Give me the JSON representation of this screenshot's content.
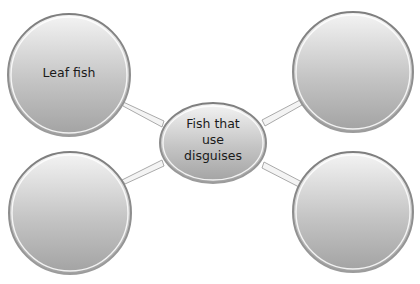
{
  "diagram": {
    "type": "bubble-map",
    "center": {
      "label_lines": [
        "Fish that",
        "use",
        "disguises"
      ],
      "shape": "ellipse",
      "cx": 213,
      "cy": 143,
      "rx": 53,
      "ry": 40
    },
    "branches": [
      {
        "position": "top-left",
        "label": "Leaf fish",
        "cx": 69,
        "cy": 75,
        "r": 61
      },
      {
        "position": "top-right",
        "label": "",
        "cx": 353,
        "cy": 72,
        "r": 60
      },
      {
        "position": "bottom-left",
        "label": "",
        "cx": 70,
        "cy": 213,
        "r": 61
      },
      {
        "position": "bottom-right",
        "label": "",
        "cx": 353,
        "cy": 212,
        "r": 60
      }
    ],
    "colors": {
      "fill_top": "#f2f2f2",
      "fill_bottom": "#a6a6a6",
      "rim": "#8c8c8c",
      "highlight": "#ffffff",
      "connector": "#9a9a9a",
      "text": "#1a1a1a"
    }
  }
}
